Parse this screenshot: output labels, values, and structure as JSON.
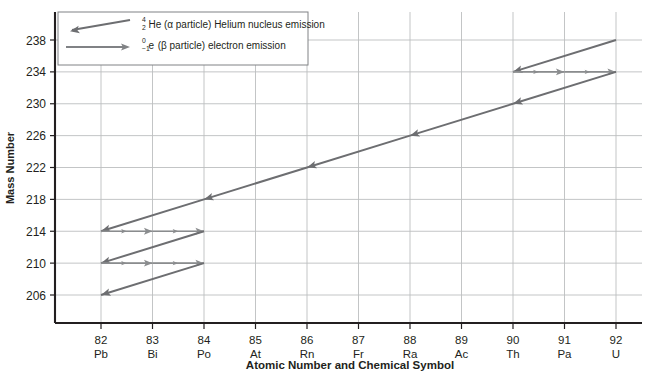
{
  "chart_data": {
    "type": "line",
    "title": "",
    "xlabel": "Atomic Number and Chemical Symbol",
    "ylabel": "Mass Number",
    "xlim": [
      81.4,
      92.6
    ],
    "ylim": [
      204.6,
      239.4
    ],
    "grid": true,
    "legend_position": "top-left",
    "x_ticks": [
      {
        "number": "82",
        "symbol": "Pb"
      },
      {
        "number": "83",
        "symbol": "Bi"
      },
      {
        "number": "84",
        "symbol": "Po"
      },
      {
        "number": "85",
        "symbol": "At"
      },
      {
        "number": "86",
        "symbol": "Rn"
      },
      {
        "number": "87",
        "symbol": "Fr"
      },
      {
        "number": "88",
        "symbol": "Ra"
      },
      {
        "number": "89",
        "symbol": "Ac"
      },
      {
        "number": "90",
        "symbol": "Th"
      },
      {
        "number": "91",
        "symbol": "Pa"
      },
      {
        "number": "92",
        "symbol": "U"
      }
    ],
    "y_ticks": [
      238,
      234,
      230,
      226,
      222,
      218,
      214,
      210,
      206
    ],
    "legend": [
      {
        "key": "alpha",
        "superscript": "4",
        "subscript": "2",
        "element": "He",
        "text": "(α particle) Helium nucleus emission",
        "color": "#6d6e71",
        "arrow": "left"
      },
      {
        "key": "beta",
        "superscript": "0",
        "subscript": "−1",
        "element": "e",
        "text": "(β particle) electron emission",
        "color": "#808285",
        "arrow": "right"
      }
    ],
    "series": [
      {
        "name": "Uranium-238 decay series",
        "decays": [
          {
            "type": "alpha",
            "from": {
              "z": 92,
              "a": 238
            },
            "to": {
              "z": 90,
              "a": 234
            }
          },
          {
            "type": "beta",
            "from": {
              "z": 90,
              "a": 234
            },
            "to": {
              "z": 91,
              "a": 234
            }
          },
          {
            "type": "beta",
            "from": {
              "z": 91,
              "a": 234
            },
            "to": {
              "z": 92,
              "a": 234
            }
          },
          {
            "type": "alpha",
            "from": {
              "z": 92,
              "a": 234
            },
            "to": {
              "z": 90,
              "a": 230
            }
          },
          {
            "type": "alpha",
            "from": {
              "z": 90,
              "a": 230
            },
            "to": {
              "z": 88,
              "a": 226
            }
          },
          {
            "type": "alpha",
            "from": {
              "z": 88,
              "a": 226
            },
            "to": {
              "z": 86,
              "a": 222
            }
          },
          {
            "type": "alpha",
            "from": {
              "z": 86,
              "a": 222
            },
            "to": {
              "z": 84,
              "a": 218
            }
          },
          {
            "type": "alpha",
            "from": {
              "z": 84,
              "a": 218
            },
            "to": {
              "z": 82,
              "a": 214
            }
          },
          {
            "type": "beta",
            "from": {
              "z": 82,
              "a": 214
            },
            "to": {
              "z": 83,
              "a": 214
            }
          },
          {
            "type": "beta",
            "from": {
              "z": 83,
              "a": 214
            },
            "to": {
              "z": 84,
              "a": 214
            }
          },
          {
            "type": "alpha",
            "from": {
              "z": 84,
              "a": 214
            },
            "to": {
              "z": 82,
              "a": 210
            }
          },
          {
            "type": "beta",
            "from": {
              "z": 82,
              "a": 210
            },
            "to": {
              "z": 83,
              "a": 210
            }
          },
          {
            "type": "beta",
            "from": {
              "z": 83,
              "a": 210
            },
            "to": {
              "z": 84,
              "a": 210
            }
          },
          {
            "type": "alpha",
            "from": {
              "z": 84,
              "a": 210
            },
            "to": {
              "z": 82,
              "a": 206
            }
          }
        ]
      }
    ],
    "colors": {
      "alpha": "#6d6e71",
      "beta": "#8a8c8e",
      "grid": "#bcbec0",
      "axis": "#231f20",
      "text": "#231f20",
      "background": "#ffffff"
    }
  }
}
